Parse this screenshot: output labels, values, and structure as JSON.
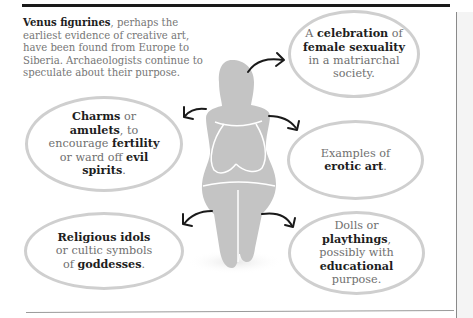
{
  "intro": {
    "bold": "Venus figurines",
    "rest": ", perhaps the earliest evidence of creative art, have been found from Europe to Siberia. Archaeologists continue to speculate about their purpose."
  },
  "bubbles": {
    "celebration": {
      "p1": "A ",
      "b1": "celebration",
      "p2": " of ",
      "b2": "female sexuality",
      "p3": " in a matriarchal society."
    },
    "charms": {
      "b1": "Charms",
      "p1": " or ",
      "b2": "amulets",
      "p2": ", to encourage ",
      "b3": "fertility",
      "p3": " or ward off ",
      "b4": "evil spirits",
      "p4": "."
    },
    "erotic": {
      "p1": "Examples of ",
      "b1": "erotic art",
      "p2": "."
    },
    "religious": {
      "b1": "Religious idols",
      "p1": " or cultic symbols of ",
      "b2": "goddesses",
      "p2": "."
    },
    "dolls": {
      "p1": "Dolls or ",
      "b1": "playthings",
      "p2": ", possibly with ",
      "b2": "educational",
      "p3": " purpose."
    }
  },
  "colors": {
    "figure": "#c4c4c4",
    "bubble_border": "#cfcfcf",
    "arrow": "#1a1a1a",
    "body_text": "#6f6f6f",
    "bold_text": "#1e1e1e"
  },
  "icons": {
    "figure": "venus-figurine-silhouette",
    "arrows": [
      "arrow-to-celebration",
      "arrow-to-charms",
      "arrow-to-erotic",
      "arrow-to-religious",
      "arrow-to-dolls"
    ]
  }
}
